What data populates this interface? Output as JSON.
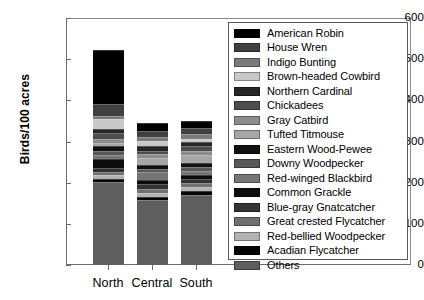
{
  "chart_data": {
    "type": "bar",
    "subtype": "stacked",
    "title": "",
    "xlabel": "",
    "ylabel": "Birds/100 acres",
    "categories": [
      "North",
      "Central",
      "South"
    ],
    "ylim": [
      0,
      600
    ],
    "yticks": [
      0,
      100,
      200,
      300,
      400,
      500,
      600
    ],
    "grid": false,
    "legend_position": "inside-upper-right",
    "totals": [
      523,
      345,
      350
    ],
    "series": [
      {
        "name": "American Robin",
        "color": "#000000",
        "values": [
          131,
          20,
          18
        ]
      },
      {
        "name": "House Wren",
        "color": "#404040",
        "values": [
          30,
          14,
          13
        ]
      },
      {
        "name": "Indigo Bunting",
        "color": "#7a7a7a",
        "values": [
          8,
          10,
          12
        ]
      },
      {
        "name": "Brown-headed Cowbird",
        "color": "#c8c8c8",
        "values": [
          24,
          11,
          9
        ]
      },
      {
        "name": "Northern Cardinal",
        "color": "#262626",
        "values": [
          10,
          12,
          10
        ]
      },
      {
        "name": "Chickadees",
        "color": "#4d4d4d",
        "values": [
          14,
          9,
          12
        ]
      },
      {
        "name": "Gray Catbird",
        "color": "#8c8c8c",
        "values": [
          9,
          9,
          8
        ]
      },
      {
        "name": "Tufted Titmouse",
        "color": "#a6a6a6",
        "values": [
          7,
          18,
          20
        ]
      },
      {
        "name": "Eastern Wood-Pewee",
        "color": "#111111",
        "values": [
          13,
          9,
          10
        ]
      },
      {
        "name": "Downy Woodpecker",
        "color": "#595959",
        "values": [
          9,
          8,
          9
        ]
      },
      {
        "name": "Red-winged Blackbird",
        "color": "#767676",
        "values": [
          11,
          19,
          10
        ]
      },
      {
        "name": "Common Grackle",
        "color": "#0d0d0d",
        "values": [
          22,
          10,
          9
        ]
      },
      {
        "name": "Blue-gray Gnatcatcher",
        "color": "#333333",
        "values": [
          10,
          12,
          11
        ]
      },
      {
        "name": "Great crested Flycatcher",
        "color": "#707070",
        "values": [
          7,
          9,
          10
        ]
      },
      {
        "name": "Red-bellied Woodpecker",
        "color": "#b3b3b3",
        "values": [
          8,
          10,
          9
        ]
      },
      {
        "name": "Acadian Flycatcher",
        "color": "#050505",
        "values": [
          8,
          7,
          9
        ]
      },
      {
        "name": "Others",
        "color": "#5e5e5e",
        "values": [
          202,
          158,
          171
        ]
      }
    ]
  },
  "legend": {
    "items": [
      "American Robin",
      "House Wren",
      "Indigo Bunting",
      "Brown-headed Cowbird",
      "Northern Cardinal",
      "Chickadees",
      "Gray Catbird",
      "Tufted Titmouse",
      "Eastern Wood-Pewee",
      "Downy Woodpecker",
      "Red-winged Blackbird",
      "Common Grackle",
      "Blue-gray Gnatcatcher",
      "Great crested Flycatcher",
      "Red-bellied Woodpecker",
      "Acadian Flycatcher",
      "Others"
    ]
  }
}
